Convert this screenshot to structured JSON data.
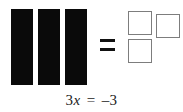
{
  "figure": {
    "type": "algebra-tile-model",
    "background_color": "#ffffff",
    "width": 183,
    "height": 112
  },
  "variable_tiles": {
    "label": "x-tiles",
    "count": 3,
    "color": "#0a0a0a",
    "items": [
      {
        "name": "bar-1",
        "x": 11,
        "y": 9,
        "w": 22,
        "h": 76
      },
      {
        "name": "bar-2",
        "x": 38,
        "y": 9,
        "w": 22,
        "h": 76
      },
      {
        "name": "bar-3",
        "x": 65,
        "y": 9,
        "w": 22,
        "h": 76
      }
    ]
  },
  "relation": {
    "symbol": "=",
    "name": "equals-sign",
    "color": "#111111",
    "x": 100,
    "y": 39,
    "w": 15,
    "h": 12
  },
  "unit_tiles": {
    "label": "unit-tiles",
    "count": 3,
    "fill_color": "#ffffff",
    "border_color": "#7d7d7d",
    "items": [
      {
        "name": "square-1",
        "x": 128,
        "y": 11,
        "size": 24
      },
      {
        "name": "square-2",
        "x": 156,
        "y": 14,
        "size": 24
      },
      {
        "name": "square-3",
        "x": 128,
        "y": 39,
        "size": 24
      }
    ]
  },
  "equation": {
    "full_text": "3x = -3",
    "coefficient": "3",
    "variable": "x",
    "relation": "=",
    "value": "–3",
    "y": 92
  }
}
